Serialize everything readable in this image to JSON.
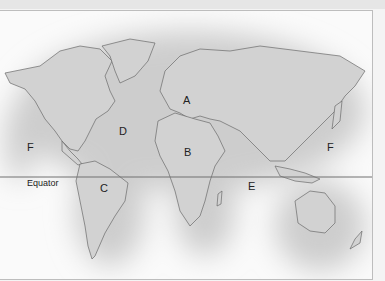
{
  "map": {
    "type": "world-map",
    "labels": [
      {
        "id": "A",
        "text": "A",
        "x": 183,
        "y": 95
      },
      {
        "id": "B",
        "text": "B",
        "x": 184,
        "y": 147
      },
      {
        "id": "C",
        "text": "C",
        "x": 100,
        "y": 183
      },
      {
        "id": "D",
        "text": "D",
        "x": 119,
        "y": 126
      },
      {
        "id": "E",
        "text": "E",
        "x": 248,
        "y": 181
      },
      {
        "id": "F-left",
        "text": "F",
        "x": 27,
        "y": 142
      },
      {
        "id": "F-right",
        "text": "F",
        "x": 327,
        "y": 142
      }
    ],
    "equator": {
      "label": "Equator",
      "y": 176
    },
    "colors": {
      "land": "#d3d3d3",
      "ocean_shade": "#c8c8c8",
      "coast": "#6a6a6a",
      "background": "#fafafa"
    }
  }
}
